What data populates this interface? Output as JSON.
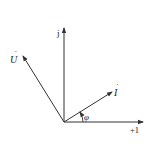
{
  "diagram": {
    "type": "phasor",
    "axes": {
      "real_label": "+1",
      "imag_label": "j"
    },
    "phasors": [
      {
        "name": "voltage",
        "label": "U",
        "dot": "̇"
      },
      {
        "name": "current",
        "label": "I",
        "dot": "̇"
      }
    ],
    "angle_label": "φ",
    "colors": {
      "line": "#333333",
      "background": "#ffffff"
    }
  }
}
